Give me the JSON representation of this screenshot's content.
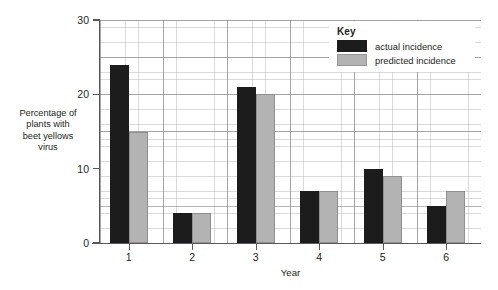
{
  "chart_data": {
    "type": "bar",
    "title": "",
    "xlabel": "Year",
    "ylabel": "Percentage of\nplants with\nbeet yellows\nvirus",
    "categories": [
      "1",
      "2",
      "3",
      "4",
      "5",
      "6"
    ],
    "series": [
      {
        "name": "actual incidence",
        "key": "actual",
        "color": "#1c1c1c",
        "values": [
          24,
          4,
          21,
          7,
          10,
          5
        ]
      },
      {
        "name": "predicted incidence",
        "key": "predicted",
        "color": "#b3b3b3",
        "values": [
          15,
          4,
          20,
          7,
          9,
          7
        ]
      }
    ],
    "ylim": [
      0,
      30
    ],
    "yticks": [
      "0",
      "10",
      "20",
      "30"
    ],
    "ytick_values": [
      0,
      10,
      20,
      30
    ],
    "grid": "major and minor gridlines shown",
    "legend_position": "top-right",
    "legend_title": "Key"
  },
  "legend": {
    "title": "Key",
    "entries": [
      {
        "label": "actual incidence",
        "swatch": "dark-swatch-icon"
      },
      {
        "label": "predicted incidence",
        "swatch": "light-swatch-icon"
      }
    ]
  },
  "axes": {
    "y_title": "Percentage of\nplants with\nbeet yellows\nvirus",
    "x_title": "Year",
    "y_labels": [
      "0",
      "10",
      "20",
      "30"
    ],
    "x_labels": [
      "1",
      "2",
      "3",
      "4",
      "5",
      "6"
    ]
  },
  "colors": {
    "actual": "#1c1c1c",
    "predicted": "#b3b3b3",
    "axis": "#58595b",
    "grid_major": "#787878",
    "grid_minor": "#aaaaaf",
    "text": "#231f20",
    "background": "#ffffff"
  }
}
